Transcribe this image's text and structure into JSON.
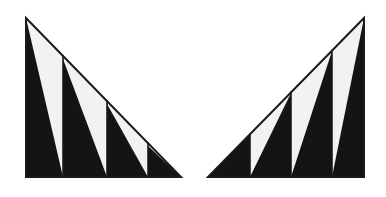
{
  "figure": {
    "canvas": {
      "width": 386,
      "height": 197
    },
    "colors": {
      "background": "#ffffff",
      "fill_light": "#f2f2f0",
      "fill_dark": "#141414",
      "outline": "#1a1a1a"
    },
    "stroke_width": 2.0,
    "divider_stroke_width": 1.6,
    "shapes": [
      {
        "name": "left-triangle",
        "orientation": "apex-top-left",
        "description": "Right triangle with the right angle at bottom-left, vertical leg on the left, horizontal leg along the bottom and hypotenuse falling left-to-right.",
        "apex": {
          "x": 26,
          "y": 18
        },
        "right_angle_corner": {
          "x": 26,
          "y": 177
        },
        "far_base_corner": {
          "x": 181,
          "y": 177
        },
        "base_y": 177,
        "strip_boundaries": [
          26,
          63,
          107,
          148,
          181
        ],
        "strips": [
          {
            "index": 0,
            "x_left": 26,
            "x_right": 63,
            "dark_triangle": [
              [
                26,
                18
              ],
              [
                26,
                177
              ],
              [
                63,
                177
              ]
            ],
            "dark_vertical_edge": "left",
            "light_triangle": [
              [
                26,
                18
              ],
              [
                63,
                139
              ],
              [
                63,
                177
              ]
            ]
          },
          {
            "index": 1,
            "x_left": 63,
            "x_right": 107,
            "dark_triangle": [
              [
                63,
                59
              ],
              [
                63,
                177
              ],
              [
                107,
                177
              ]
            ],
            "dark_vertical_edge": "left",
            "light_triangle": [
              [
                63,
                59
              ],
              [
                107,
                104
              ],
              [
                107,
                177
              ]
            ]
          },
          {
            "index": 2,
            "x_left": 107,
            "x_right": 148,
            "dark_triangle": [
              [
                107,
                104
              ],
              [
                107,
                177
              ],
              [
                148,
                177
              ]
            ],
            "dark_vertical_edge": "left",
            "light_triangle": [
              [
                107,
                104
              ],
              [
                148,
                146
              ],
              [
                148,
                177
              ]
            ]
          },
          {
            "index": 3,
            "x_left": 148,
            "x_right": 181,
            "dark_triangle": [
              [
                148,
                146
              ],
              [
                148,
                177
              ],
              [
                181,
                177
              ]
            ],
            "dark_vertical_edge": "left",
            "light_triangle": [
              [
                148,
                146
              ],
              [
                181,
                177
              ],
              [
                181,
                177
              ]
            ]
          }
        ]
      },
      {
        "name": "right-triangle",
        "orientation": "apex-top-right",
        "description": "Mirror image of the left figure: right angle at bottom-right, vertical leg on the right, hypotenuse rising left-to-right.",
        "apex": {
          "x": 364,
          "y": 18
        },
        "right_angle_corner": {
          "x": 364,
          "y": 177
        },
        "far_base_corner": {
          "x": 208,
          "y": 177
        },
        "base_y": 177,
        "strip_boundaries": [
          208,
          250,
          291,
          332,
          364
        ],
        "strips": [
          {
            "index": 0,
            "x_left": 208,
            "x_right": 250,
            "dark_triangle": [
              [
                250,
                135
              ],
              [
                250,
                177
              ],
              [
                208,
                177
              ]
            ],
            "dark_vertical_edge": "right",
            "light_triangle": [
              [
                208,
                177
              ],
              [
                250,
                135
              ],
              [
                250,
                177
              ]
            ]
          },
          {
            "index": 1,
            "x_left": 250,
            "x_right": 291,
            "dark_triangle": [
              [
                291,
                93
              ],
              [
                291,
                177
              ],
              [
                250,
                177
              ]
            ],
            "dark_vertical_edge": "right",
            "light_triangle": [
              [
                250,
                135
              ],
              [
                291,
                93
              ],
              [
                250,
                177
              ]
            ]
          },
          {
            "index": 2,
            "x_left": 291,
            "x_right": 332,
            "dark_triangle": [
              [
                332,
                51
              ],
              [
                332,
                177
              ],
              [
                291,
                177
              ]
            ],
            "dark_vertical_edge": "right",
            "light_triangle": [
              [
                291,
                93
              ],
              [
                332,
                51
              ],
              [
                291,
                177
              ]
            ]
          },
          {
            "index": 3,
            "x_left": 332,
            "x_right": 364,
            "dark_triangle": [
              [
                364,
                18
              ],
              [
                364,
                177
              ],
              [
                332,
                177
              ]
            ],
            "dark_vertical_edge": "right",
            "light_triangle": [
              [
                332,
                51
              ],
              [
                364,
                18
              ],
              [
                332,
                177
              ]
            ]
          }
        ]
      }
    ]
  }
}
